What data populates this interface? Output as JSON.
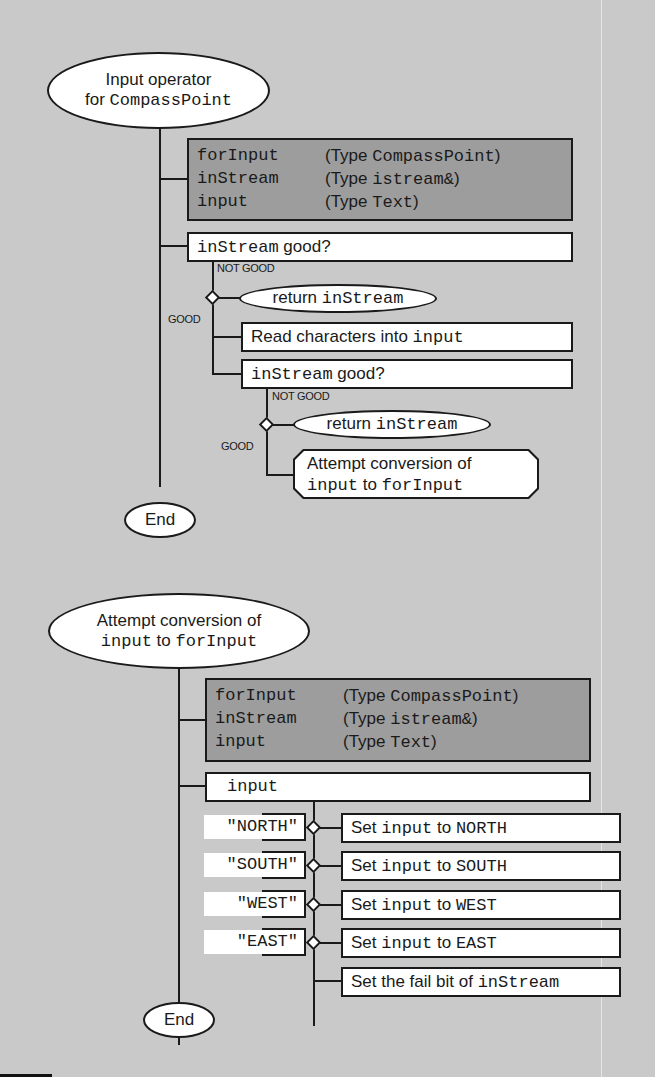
{
  "diagram1": {
    "start": {
      "line1": "Input operator",
      "line2_prefix": "for ",
      "line2_code": "CompassPoint"
    },
    "variables": [
      {
        "name": "forInput",
        "type_prefix": "(Type ",
        "type_code": "CompassPoint",
        "type_suffix": ")"
      },
      {
        "name": "inStream",
        "type_prefix": "(Type ",
        "type_code": "istream&",
        "type_suffix": ")"
      },
      {
        "name": "input",
        "type_prefix": "(Type ",
        "type_code": "Text",
        "type_suffix": ")"
      }
    ],
    "check1": {
      "code": "inStream",
      "text": " good?"
    },
    "not_good_label_1": "NOT GOOD",
    "good_label_1": "GOOD",
    "return1": {
      "text": "return ",
      "code": "inStream"
    },
    "read_step": {
      "text": "Read characters into ",
      "code": "input"
    },
    "check2": {
      "code": "inStream",
      "text": " good?"
    },
    "not_good_label_2": "NOT GOOD",
    "good_label_2": "GOOD",
    "return2": {
      "text": "return ",
      "code": "inStream"
    },
    "subproc": {
      "line1": "Attempt conversion of",
      "line2_code1": "input",
      "line2_text": " to ",
      "line2_code2": "forInput"
    },
    "end": "End"
  },
  "diagram2": {
    "start": {
      "line1": "Attempt conversion of",
      "line2_code1": "input",
      "line2_text": " to ",
      "line2_code2": "forInput"
    },
    "variables": [
      {
        "name": "forInput",
        "type_prefix": "(Type ",
        "type_code": "CompassPoint",
        "type_suffix": ")"
      },
      {
        "name": "inStream",
        "type_prefix": "(Type ",
        "type_code": "istream&",
        "type_suffix": ")"
      },
      {
        "name": "input",
        "type_prefix": "(Type ",
        "type_code": "Text",
        "type_suffix": ")"
      }
    ],
    "switch_on": "input",
    "cases": [
      {
        "label": "\"NORTH\"",
        "action_text": "Set ",
        "action_code": "input",
        "action_mid": " to ",
        "action_value": "NORTH"
      },
      {
        "label": "\"SOUTH\"",
        "action_text": "Set ",
        "action_code": "input",
        "action_mid": " to ",
        "action_value": "SOUTH"
      },
      {
        "label": "\"WEST\"",
        "action_text": "Set ",
        "action_code": "input",
        "action_mid": " to ",
        "action_value": "WEST"
      },
      {
        "label": "\"EAST\"",
        "action_text": "Set ",
        "action_code": "input",
        "action_mid": " to ",
        "action_value": "EAST"
      }
    ],
    "default_action": {
      "text": "Set the fail bit of ",
      "code": "inStream"
    },
    "end": "End"
  }
}
